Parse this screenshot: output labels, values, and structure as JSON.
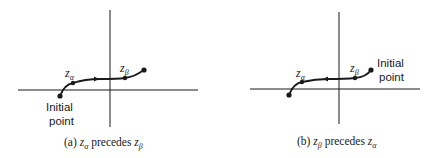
{
  "figure": {
    "panels": [
      {
        "id": "a",
        "caption": {
          "prefix": "(a) ",
          "first": "z",
          "first_sub": "α",
          "middle": " precedes ",
          "second": "z",
          "second_sub": "β"
        },
        "labels": {
          "z_alpha": {
            "base": "z",
            "sub": "α"
          },
          "z_beta": {
            "base": "z",
            "sub": "β"
          },
          "initial_point_line1": "Initial",
          "initial_point_line2": "point"
        },
        "initial_point_location": "lower-left end",
        "arrow_direction": "right"
      },
      {
        "id": "b",
        "caption": {
          "prefix": "(b) ",
          "first": "z",
          "first_sub": "β",
          "middle": " precedes ",
          "second": "z",
          "second_sub": "α"
        },
        "labels": {
          "z_alpha": {
            "base": "z",
            "sub": "α"
          },
          "z_beta": {
            "base": "z",
            "sub": "β"
          },
          "initial_point_line1": "Initial",
          "initial_point_line2": "point"
        },
        "initial_point_location": "upper-right end",
        "arrow_direction": "left"
      }
    ],
    "colors": {
      "ink": "#1a1a1a",
      "background": "#ffffff"
    }
  }
}
